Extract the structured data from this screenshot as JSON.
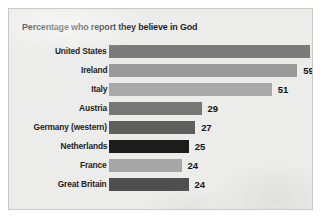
{
  "chart_data": {
    "type": "bar",
    "orientation": "horizontal",
    "title": "Percentage who report they believe in God",
    "xlabel": "",
    "ylabel": "",
    "categories": [
      "United States",
      "Ireland",
      "Italy",
      "Austria",
      "Germany (western)",
      "Netherlands",
      "France",
      "Great Britain"
    ],
    "values": [
      63,
      59,
      51,
      29,
      27,
      25,
      24,
      24
    ],
    "value_labels": [
      "63",
      "59",
      "51",
      "29",
      "27",
      "25",
      "24",
      "24"
    ],
    "bar_colors": [
      "#7b7b7b",
      "#9a9a9a",
      "#a9a9a9",
      "#777777",
      "#5f5f5f",
      "#1c1c1c",
      "#a6a6a6",
      "#4f4f4f"
    ],
    "xlim": [
      0,
      63
    ],
    "grid": false,
    "legend": false,
    "axis_visible": false,
    "bars": [
      {
        "category": "United States",
        "value": 63,
        "label": "63",
        "color": "#7b7b7b"
      },
      {
        "category": "Ireland",
        "value": 59,
        "label": "59",
        "color": "#9a9a9a"
      },
      {
        "category": "Italy",
        "value": 51,
        "label": "51",
        "color": "#a9a9a9"
      },
      {
        "category": "Austria",
        "value": 29,
        "label": "29",
        "color": "#777777"
      },
      {
        "category": "Germany (western)",
        "value": 27,
        "label": "27",
        "color": "#5f5f5f"
      },
      {
        "category": "Netherlands",
        "value": 25,
        "label": "25",
        "color": "#1c1c1c"
      },
      {
        "category": "France",
        "value": 24,
        "label": "24",
        "color": "#a6a6a6"
      },
      {
        "category": "Great Britain",
        "value": 24,
        "label": "24",
        "color": "#4f4f4f"
      }
    ]
  },
  "figure": {
    "background_color": "#ececea",
    "border_color": "#c9c9c6",
    "page_background": "#ffffff"
  }
}
